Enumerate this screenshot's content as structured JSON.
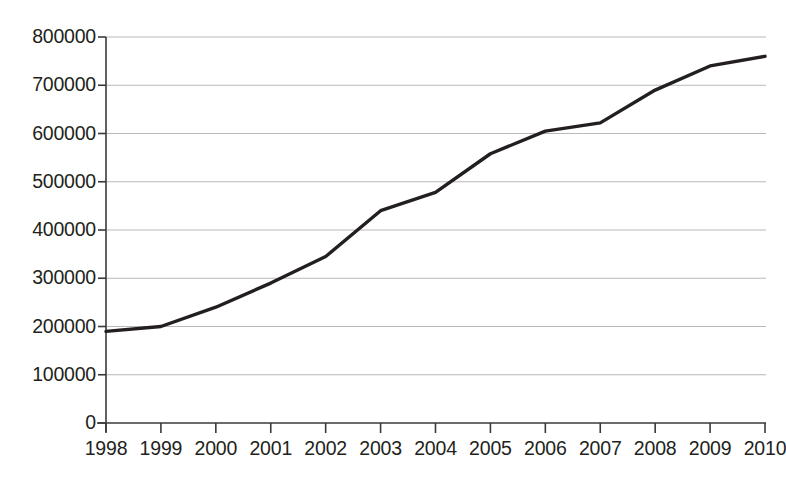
{
  "chart_data": {
    "type": "line",
    "title": "",
    "subtitle": "",
    "xlabel": "",
    "ylabel": "",
    "categories": [
      "1998",
      "1999",
      "2000",
      "2001",
      "2002",
      "2003",
      "2004",
      "2005",
      "2006",
      "2007",
      "2008",
      "2009",
      "2010"
    ],
    "x": [
      1998,
      1999,
      2000,
      2001,
      2002,
      2003,
      2004,
      2005,
      2006,
      2007,
      2008,
      2009,
      2010
    ],
    "values": [
      190000,
      200000,
      240000,
      290000,
      345000,
      440000,
      478000,
      558000,
      605000,
      622000,
      690000,
      740000,
      760000
    ],
    "series": [
      {
        "name": "",
        "values": [
          190000,
          200000,
          240000,
          290000,
          345000,
          440000,
          478000,
          558000,
          605000,
          622000,
          690000,
          740000,
          760000
        ]
      }
    ],
    "ylim": [
      0,
      800000
    ],
    "ytick_values": [
      0,
      100000,
      200000,
      300000,
      400000,
      500000,
      600000,
      700000,
      800000
    ],
    "ytick_labels": [
      "0",
      "100000",
      "200000",
      "300000",
      "400000",
      "500000",
      "600000",
      "700000",
      "800000"
    ],
    "xlim": [
      1997.5,
      2010.5
    ],
    "grid": "horizontal",
    "legend": "none",
    "annotations": [],
    "colors": {
      "line": "#231f20",
      "grid": "#b9b9b9",
      "axis": "#3a3a3a",
      "text": "#231f20",
      "background": "#ffffff"
    },
    "line_width_px": 3.4
  }
}
